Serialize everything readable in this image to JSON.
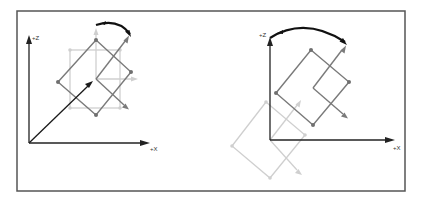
{
  "figure": {
    "colors": {
      "frame": "#555555",
      "axis": "#222222",
      "object_current": "#7a7a7a",
      "object_ghost": "#cfcfcf",
      "rotation_arrow": "#111111"
    },
    "panels": [
      {
        "id": "left",
        "axis_labels": {
          "z": "+Z",
          "x": "+X"
        },
        "caption": "Rotation about object's own center (local pivot)"
      },
      {
        "id": "right",
        "axis_labels": {
          "z": "+Z",
          "x": "+X"
        },
        "caption": "Rotation about world origin (global pivot)"
      }
    ]
  }
}
